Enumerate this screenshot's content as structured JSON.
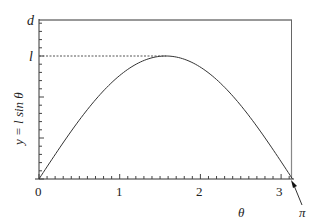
{
  "chart_data": {
    "type": "line",
    "title": "",
    "xlabel": "θ",
    "ylabel": "y = l sin θ",
    "xlim": [
      0,
      3.2
    ],
    "ylim": [
      0,
      1.36
    ],
    "x_ticks": [
      "0",
      "1",
      "2",
      "3"
    ],
    "y_tick_labels": [
      "l",
      "d"
    ],
    "series": [
      {
        "name": "y = l sin θ",
        "x": [
          0,
          0.2,
          0.4,
          0.6,
          0.8,
          1.0,
          1.2,
          1.4,
          1.5708,
          1.8,
          2.0,
          2.2,
          2.4,
          2.6,
          2.8,
          3.0,
          3.1416
        ],
        "values": [
          0,
          0.199,
          0.389,
          0.565,
          0.717,
          0.841,
          0.932,
          0.985,
          1.0,
          0.974,
          0.909,
          0.808,
          0.675,
          0.516,
          0.335,
          0.141,
          0
        ]
      }
    ],
    "annotations": [
      {
        "text": "l",
        "type": "dashed-horizontal-line",
        "y": 1.0,
        "x_end": 1.5708
      },
      {
        "text": "d",
        "type": "horizontal-frame-line",
        "y": 1.36
      },
      {
        "text": "π",
        "type": "arrow",
        "points_to_x": 3.1416
      },
      {
        "type": "vertical-line",
        "x": 3.1416
      }
    ],
    "grid": false,
    "legend": null
  },
  "labels": {
    "y_axis": "y = l sin θ",
    "x_axis": "θ",
    "d": "d",
    "l": "l",
    "pi": "π",
    "x0": "0",
    "x1": "1",
    "x2": "2",
    "x3": "3"
  }
}
